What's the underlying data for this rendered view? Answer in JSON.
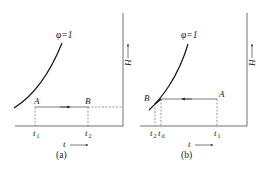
{
  "figure": {
    "panels": [
      {
        "id": "a",
        "caption": "(a)",
        "curve_label": "φ=1",
        "x_axis_label": "t",
        "y_axis_label": "H",
        "points": {
          "start": "A",
          "end": "B"
        },
        "ticks": [
          {
            "main": "t",
            "sub": "1"
          },
          {
            "main": "t",
            "sub": "2"
          }
        ],
        "process": "heating at constant humidity, A → B"
      },
      {
        "id": "b",
        "caption": "(b)",
        "curve_label": "φ=1",
        "x_axis_label": "t",
        "y_axis_label": "H",
        "points": {
          "start": "A",
          "end": "B"
        },
        "ticks": [
          {
            "main": "t",
            "sub": "2"
          },
          {
            "main": "t",
            "sub": "d"
          },
          {
            "main": "t",
            "sub": "1"
          }
        ],
        "process": "cooling at constant humidity, A → B through dew point"
      }
    ],
    "colors": {
      "line": "#222222",
      "dashed": "#555555",
      "background": "#ffffff"
    }
  }
}
